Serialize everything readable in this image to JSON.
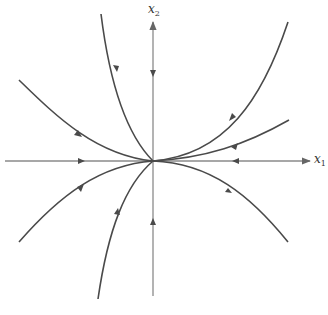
{
  "diagram": {
    "type": "phase-portrait",
    "axes": {
      "x_label": "x",
      "x_subscript": "1",
      "y_label": "x",
      "y_subscript": "2"
    },
    "colors": {
      "axis": "#8a8a8a",
      "trajectory": "#4a4a4a",
      "background": "#ffffff"
    },
    "origin": {
      "x": 153,
      "y": 161
    },
    "trajectories": [
      {
        "name": "upper-left-steep",
        "direction": "toward-origin"
      },
      {
        "name": "upper-left-shallow",
        "direction": "toward-origin"
      },
      {
        "name": "upper-right-steep",
        "direction": "toward-origin"
      },
      {
        "name": "upper-right-shallow",
        "direction": "toward-origin"
      },
      {
        "name": "lower-left-steep",
        "direction": "toward-origin"
      },
      {
        "name": "lower-left-shallow",
        "direction": "toward-origin"
      },
      {
        "name": "lower-right",
        "direction": "toward-origin"
      },
      {
        "name": "negative-x1-axis",
        "direction": "toward-origin"
      },
      {
        "name": "positive-x1-axis",
        "direction": "toward-origin"
      },
      {
        "name": "positive-x2-axis",
        "direction": "toward-origin"
      },
      {
        "name": "negative-x2-axis",
        "direction": "toward-origin"
      }
    ]
  }
}
